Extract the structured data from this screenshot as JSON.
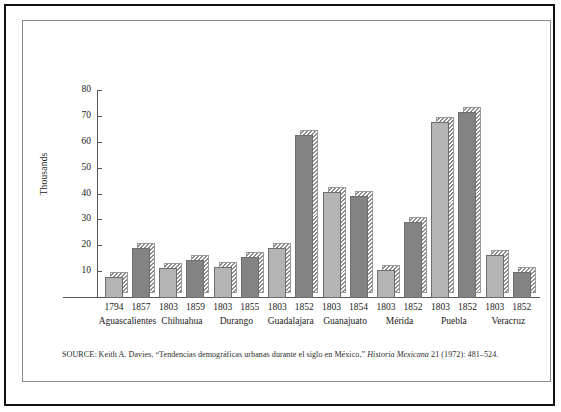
{
  "figure": {
    "y_axis_title": "Thousands",
    "source_prefix": "SOURCE: Keith A. Davies, “Tendencias demográficas urbanas durante el siglo en México,” ",
    "source_italic": "Historia Mexicana",
    "source_suffix": " 21 (1972): 481–524."
  },
  "chart_data": {
    "type": "bar",
    "title": "",
    "xlabel": "",
    "ylabel": "Thousands",
    "ylim": [
      0,
      80
    ],
    "yticks": [
      10,
      20,
      30,
      40,
      50,
      60,
      70,
      80
    ],
    "ytick_labels": [
      "10",
      "20",
      "30",
      "40",
      "50",
      "60",
      "70",
      "80"
    ],
    "grid": false,
    "legend": "none",
    "categories": [
      "Aguascalientes",
      "Chihuahua",
      "Durango",
      "Guadalajara",
      "Guanajuato",
      "Mérida",
      "Puebla",
      "Veracruz"
    ],
    "groups": [
      {
        "city": "Aguascalientes",
        "bars": [
          {
            "year": "1794",
            "value": 8.0,
            "shade": "light"
          },
          {
            "year": "1857",
            "value": 19.5,
            "shade": "dark"
          }
        ]
      },
      {
        "city": "Chihuahua",
        "bars": [
          {
            "year": "1803",
            "value": 11.5,
            "shade": "light"
          },
          {
            "year": "1859",
            "value": 14.5,
            "shade": "dark"
          }
        ]
      },
      {
        "city": "Durango",
        "bars": [
          {
            "year": "1803",
            "value": 12.0,
            "shade": "light"
          },
          {
            "year": "1855",
            "value": 16.0,
            "shade": "dark"
          }
        ]
      },
      {
        "city": "Guadalajara",
        "bars": [
          {
            "year": "1803",
            "value": 19.5,
            "shade": "light"
          },
          {
            "year": "1852",
            "value": 63.0,
            "shade": "dark"
          }
        ]
      },
      {
        "city": "Guanajuato",
        "bars": [
          {
            "year": "1803",
            "value": 41.0,
            "shade": "light"
          },
          {
            "year": "1854",
            "value": 39.5,
            "shade": "dark"
          }
        ]
      },
      {
        "city": "Mérida",
        "bars": [
          {
            "year": "1803",
            "value": 11.0,
            "shade": "light"
          },
          {
            "year": "1852",
            "value": 29.5,
            "shade": "dark"
          }
        ]
      },
      {
        "city": "Puebla",
        "bars": [
          {
            "year": "1803",
            "value": 68.0,
            "shade": "light"
          },
          {
            "year": "1852",
            "value": 72.0,
            "shade": "dark"
          }
        ]
      },
      {
        "city": "Veracruz",
        "bars": [
          {
            "year": "1803",
            "value": 16.5,
            "shade": "light"
          },
          {
            "year": "1852",
            "value": 10.0,
            "shade": "dark"
          }
        ]
      }
    ],
    "colors": {
      "bar_light": "#b4b4b4",
      "bar_dark": "#838383",
      "axis": "#555555",
      "text": "#1a1a1a",
      "frame": "#111111"
    }
  }
}
